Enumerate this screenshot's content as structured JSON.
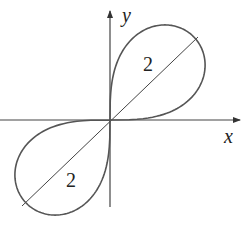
{
  "diagram": {
    "axes": {
      "x_label": "x",
      "y_label": "y"
    },
    "lobes": [
      {
        "position": "upper-right",
        "label": "2"
      },
      {
        "position": "lower-left",
        "label": "2"
      }
    ],
    "colors": {
      "curve": "#555555",
      "axes": "#333333",
      "line": "#444444",
      "text": "#222222"
    }
  }
}
